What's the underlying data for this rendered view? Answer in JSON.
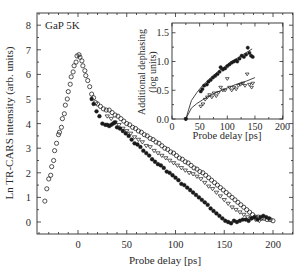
{
  "chart_data": [
    {
      "type": "scatter",
      "title": "",
      "annotation": "GaP 5K",
      "xlabel": "Probe delay [ps]",
      "ylabel": "Ln TR-CARS intensity (arb. units)",
      "xlim": [
        -42,
        222
      ],
      "ylim": [
        -0.5,
        8.5
      ],
      "xticks": [
        0,
        50,
        100,
        150,
        200
      ],
      "yticks": [
        0,
        1,
        2,
        3,
        4,
        5,
        6,
        7,
        8
      ],
      "grid": false,
      "series": [
        {
          "name": "open circles",
          "marker": "open-circle",
          "x": [
            -34,
            -32,
            -30,
            -28,
            -27,
            -25,
            -24,
            -22,
            -20,
            -19,
            -17,
            -16,
            -14,
            -13,
            -11,
            -10,
            -8,
            -7,
            -5,
            -4,
            -2,
            -1,
            1,
            2,
            4,
            5,
            7,
            8,
            10,
            12,
            14,
            16,
            18,
            20,
            23,
            26,
            29,
            32,
            35,
            38,
            41,
            44,
            47,
            50,
            53,
            56,
            59,
            62,
            65,
            68,
            71,
            74,
            77,
            80,
            83,
            86,
            89,
            92,
            95,
            98,
            101,
            104,
            107,
            110,
            113,
            116,
            119,
            122,
            125,
            128,
            131,
            134,
            137,
            140,
            143,
            146,
            149,
            152,
            155,
            158,
            161,
            164,
            167,
            170,
            173,
            176,
            179,
            182,
            185,
            188,
            191,
            194,
            197,
            200
          ],
          "y": [
            0.85,
            1.35,
            1.75,
            1.9,
            2.25,
            2.5,
            2.9,
            3.2,
            3.55,
            3.65,
            3.85,
            4.2,
            4.4,
            4.75,
            5.0,
            5.3,
            5.6,
            5.9,
            6.1,
            6.35,
            6.5,
            6.75,
            6.8,
            6.7,
            6.55,
            6.35,
            6.15,
            5.95,
            5.75,
            5.5,
            5.2,
            5.05,
            4.85,
            4.8,
            4.7,
            4.6,
            4.55,
            4.55,
            4.45,
            4.35,
            4.3,
            4.2,
            4.1,
            4.0,
            3.95,
            3.85,
            3.8,
            3.7,
            3.65,
            3.55,
            3.5,
            3.4,
            3.35,
            3.25,
            3.2,
            3.1,
            3.0,
            2.95,
            2.85,
            2.8,
            2.7,
            2.6,
            2.55,
            2.45,
            2.4,
            2.3,
            2.2,
            2.15,
            2.05,
            2.0,
            1.9,
            1.8,
            1.7,
            1.6,
            1.5,
            1.4,
            1.3,
            1.2,
            1.1,
            1.0,
            0.9,
            0.8,
            0.7,
            0.6,
            0.5,
            0.4,
            0.3,
            0.2,
            0.2,
            0.15,
            0.15,
            0.1,
            0.1,
            0.05
          ]
        },
        {
          "name": "filled circles",
          "marker": "filled-circle",
          "x": [
            14,
            16,
            19,
            22,
            25,
            28,
            30,
            32,
            34,
            36,
            38,
            40,
            43,
            46,
            49,
            52,
            55,
            58,
            61,
            64,
            67,
            70,
            73,
            76,
            79,
            82,
            85,
            88,
            91,
            94,
            97,
            100,
            103,
            106,
            109,
            112,
            115,
            118,
            121,
            124,
            127,
            130,
            133,
            136,
            139,
            142,
            145,
            148,
            151,
            154,
            157,
            160,
            163,
            166,
            169,
            172,
            175,
            178,
            181,
            184,
            187,
            190,
            193,
            196
          ],
          "y": [
            5.0,
            4.8,
            4.5,
            4.3,
            4.0,
            3.95,
            3.95,
            3.9,
            3.95,
            4.0,
            4.05,
            3.85,
            3.8,
            3.7,
            3.6,
            3.5,
            3.35,
            3.2,
            3.15,
            3.05,
            2.9,
            2.8,
            2.7,
            2.55,
            2.45,
            2.35,
            2.3,
            2.2,
            2.05,
            2.0,
            1.9,
            1.8,
            1.7,
            1.55,
            1.5,
            1.4,
            1.3,
            1.2,
            1.1,
            1.0,
            0.9,
            0.8,
            0.7,
            0.55,
            0.45,
            0.35,
            0.25,
            0.15,
            0.05,
            0.0,
            -0.05,
            0.05,
            0.0,
            0.05,
            0.1,
            0.1,
            0.05,
            0.15,
            0.2,
            0.1,
            0.2,
            0.25,
            0.2,
            0.15
          ]
        },
        {
          "name": "open triangles",
          "marker": "open-triangle",
          "x": [
            30,
            34,
            38,
            42,
            46,
            50,
            54,
            58,
            62,
            66,
            70,
            74,
            78,
            82,
            86,
            90,
            94,
            98,
            102,
            106,
            110,
            114,
            118,
            122,
            126,
            130,
            134,
            138,
            142,
            146,
            150,
            154,
            158,
            162,
            166,
            170,
            174,
            178,
            182,
            186
          ],
          "y": [
            4.3,
            4.2,
            4.05,
            3.95,
            3.8,
            3.7,
            3.6,
            3.45,
            3.35,
            3.25,
            3.1,
            3.05,
            2.9,
            2.8,
            2.7,
            2.6,
            2.5,
            2.4,
            2.3,
            2.2,
            2.1,
            2.0,
            1.95,
            1.85,
            1.75,
            1.6,
            1.45,
            1.35,
            1.2,
            1.05,
            0.9,
            0.75,
            0.6,
            0.5,
            0.4,
            0.3,
            0.2,
            0.15,
            0.1,
            0.05
          ]
        }
      ]
    },
    {
      "type": "scatter",
      "title": "inset",
      "xlabel": "Probe delay [ps]",
      "ylabel": "Additional dephasing (log units)",
      "xlim": [
        0,
        200
      ],
      "ylim": [
        0.0,
        1.6
      ],
      "xticks": [
        0,
        50,
        100,
        150,
        200
      ],
      "yticks": [
        0.0,
        0.5,
        1.0,
        1.5
      ],
      "grid": false,
      "series": [
        {
          "name": "filled circles",
          "marker": "filled-circle",
          "x": [
            25,
            52,
            55,
            58,
            63,
            66,
            70,
            74,
            78,
            82,
            86,
            88,
            92,
            96,
            100,
            104,
            108,
            112,
            116,
            118,
            122,
            126,
            130,
            134,
            137,
            140,
            143,
            146
          ],
          "y": [
            0.0,
            0.48,
            0.52,
            0.58,
            0.6,
            0.65,
            0.68,
            0.72,
            0.75,
            0.78,
            0.82,
            0.9,
            0.86,
            0.88,
            0.92,
            0.95,
            0.98,
            1.0,
            1.02,
            1.0,
            1.05,
            1.1,
            1.08,
            1.12,
            1.24,
            1.15,
            1.1,
            1.08
          ]
        },
        {
          "name": "open triangles",
          "marker": "open-triangle",
          "x": [
            25,
            52,
            56,
            60,
            64,
            68,
            72,
            76,
            80,
            84,
            88,
            92,
            96,
            100,
            104,
            108,
            112,
            116,
            120,
            124,
            128,
            132,
            136,
            140,
            144,
            146
          ],
          "y": [
            0.0,
            0.22,
            0.26,
            0.34,
            0.38,
            0.42,
            0.38,
            0.45,
            0.4,
            0.46,
            0.55,
            0.5,
            0.5,
            0.7,
            0.55,
            0.5,
            0.55,
            0.52,
            0.58,
            0.6,
            0.62,
            0.58,
            0.78,
            0.6,
            0.55,
            0.62
          ]
        },
        {
          "name": "fit upper",
          "marker": "line",
          "x": [
            25,
            35,
            45,
            55,
            65,
            75,
            85,
            95,
            105,
            115,
            125,
            135,
            145
          ],
          "y": [
            0.0,
            0.32,
            0.46,
            0.58,
            0.67,
            0.76,
            0.84,
            0.91,
            0.98,
            1.04,
            1.1,
            1.16,
            1.22
          ]
        },
        {
          "name": "fit lower",
          "marker": "line",
          "x": [
            25,
            35,
            45,
            55,
            65,
            75,
            85,
            95,
            105,
            115,
            125,
            135,
            150
          ],
          "y": [
            0.0,
            0.19,
            0.27,
            0.33,
            0.39,
            0.44,
            0.48,
            0.52,
            0.56,
            0.6,
            0.63,
            0.66,
            0.72
          ]
        }
      ]
    }
  ],
  "labels": {
    "main_annotation": "GaP 5K",
    "main_xlabel": "Probe delay [ps]",
    "main_ylabel": "Ln TR-CARS intensity (arb. units)",
    "inset_xlabel": "Probe delay [ps]",
    "inset_ylabel_line1": "Additional dephasing",
    "inset_ylabel_line2": "(log units)",
    "main_xticks": [
      "0",
      "50",
      "100",
      "150",
      "200"
    ],
    "main_yticks": [
      "0",
      "1",
      "2",
      "3",
      "4",
      "5",
      "6",
      "7",
      "8"
    ],
    "inset_xticks": [
      "0",
      "50",
      "100",
      "150",
      "200"
    ],
    "inset_yticks": [
      "0.0",
      "0.5",
      "1.0",
      "1.5"
    ]
  },
  "colors": {
    "axis": "#2a2a2a",
    "marker": "#1a1a1a",
    "background": "#ffffff"
  }
}
